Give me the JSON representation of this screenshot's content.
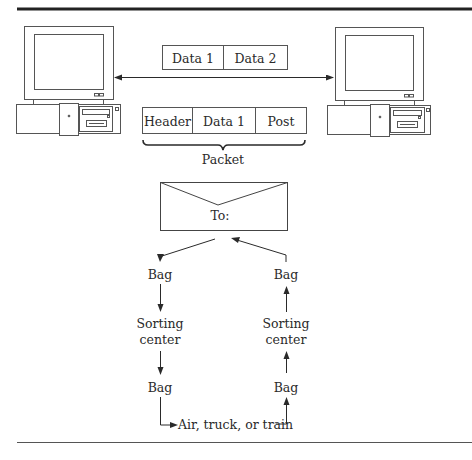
{
  "diagram": {
    "top_packet": {
      "cells": [
        "Data 1",
        "Data 2"
      ]
    },
    "framed_packet": {
      "cells": [
        "Header",
        "Data 1",
        "Post"
      ],
      "brace_label": "Packet"
    },
    "envelope": {
      "label": "To:"
    },
    "left_path": {
      "nodes": [
        "Bag",
        "Sorting\ncenter",
        "Bag"
      ]
    },
    "right_path": {
      "nodes": [
        "Bag",
        "Sorting\ncenter",
        "Bag"
      ]
    },
    "left_path_labels": {
      "bag_top": "Bag",
      "sorting_1": "Sorting",
      "sorting_2": "center",
      "bag_bottom": "Bag"
    },
    "right_path_labels": {
      "bag_top": "Bag",
      "sorting_1": "Sorting",
      "sorting_2": "center",
      "bag_bottom": "Bag"
    },
    "transport": {
      "label": "Air, truck, or train"
    },
    "computers": [
      "left-computer",
      "right-computer"
    ]
  }
}
